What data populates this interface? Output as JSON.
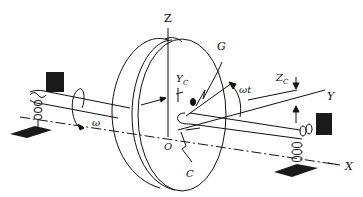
{
  "diagram": {
    "labels": {
      "z_axis": "Z",
      "y_axis": "Y",
      "x_axis": "X",
      "origin": "O",
      "center_of_mass": "G",
      "geometric_center": "C",
      "yc": "Y",
      "yc_sub": "C",
      "zc": "Z",
      "zc_sub": "C",
      "omega_t": "ωt",
      "omega": "ω"
    },
    "colors": {
      "stroke": "#111111",
      "fill_dark": "#1a1a1a",
      "background": "#ffffff"
    }
  }
}
